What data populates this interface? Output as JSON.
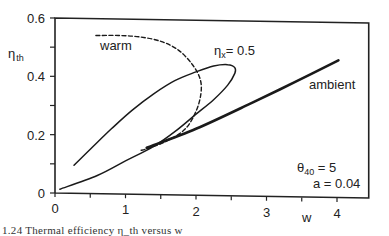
{
  "chart_data": {
    "type": "line",
    "title": "",
    "xlabel": "w",
    "ylabel": "η_th",
    "xlim": [
      0,
      4.45
    ],
    "ylim": [
      0,
      0.6
    ],
    "grid": false,
    "legend": "none (inline curve labels)",
    "x_ticks": [
      {
        "value": 0,
        "label": "0"
      },
      {
        "value": 0.5,
        "label": ""
      },
      {
        "value": 1,
        "label": "1"
      },
      {
        "value": 1.5,
        "label": ""
      },
      {
        "value": 2,
        "label": "2"
      },
      {
        "value": 2.5,
        "label": ""
      },
      {
        "value": 3,
        "label": "3"
      },
      {
        "value": 3.5,
        "label": ""
      },
      {
        "value": 4,
        "label": "4"
      }
    ],
    "y_ticks": [
      {
        "value": 0,
        "label": "0"
      },
      {
        "value": 0.1,
        "label": ""
      },
      {
        "value": 0.2,
        "label": "0.2"
      },
      {
        "value": 0.3,
        "label": ""
      },
      {
        "value": 0.4,
        "label": "0.4"
      },
      {
        "value": 0.5,
        "label": ""
      },
      {
        "value": 0.6,
        "label": "0.6"
      }
    ],
    "series": [
      {
        "name": "warm",
        "style": "dashed",
        "points": [
          [
            0.58,
            0.54
          ],
          [
            0.9,
            0.54
          ],
          [
            1.2,
            0.535
          ],
          [
            1.5,
            0.52
          ],
          [
            1.75,
            0.49
          ],
          [
            1.95,
            0.44
          ],
          [
            2.06,
            0.39
          ],
          [
            2.07,
            0.34
          ],
          [
            2.0,
            0.28
          ],
          [
            1.85,
            0.22
          ],
          [
            1.6,
            0.18
          ],
          [
            1.35,
            0.155
          ],
          [
            1.2,
            0.145
          ]
        ]
      },
      {
        "name": "η_x = 0.5",
        "style": "solid",
        "points": [
          [
            0.27,
            0.095
          ],
          [
            0.5,
            0.15
          ],
          [
            0.8,
            0.22
          ],
          [
            1.1,
            0.285
          ],
          [
            1.4,
            0.34
          ],
          [
            1.7,
            0.385
          ],
          [
            2.0,
            0.415
          ],
          [
            2.25,
            0.435
          ],
          [
            2.45,
            0.44
          ],
          [
            2.55,
            0.43
          ],
          [
            2.55,
            0.41
          ],
          [
            2.45,
            0.37
          ],
          [
            2.25,
            0.32
          ],
          [
            2.0,
            0.27
          ],
          [
            1.7,
            0.21
          ],
          [
            1.4,
            0.16
          ],
          [
            1.0,
            0.11
          ],
          [
            0.6,
            0.06
          ],
          [
            0.07,
            0.013
          ]
        ]
      },
      {
        "name": "ambient",
        "style": "solid-thick",
        "points": [
          [
            1.3,
            0.155
          ],
          [
            2.0,
            0.22
          ],
          [
            2.8,
            0.31
          ],
          [
            3.4,
            0.38
          ],
          [
            4.02,
            0.455
          ]
        ]
      }
    ],
    "annotations": [
      {
        "text": "warm",
        "x": 0.68,
        "y": 0.5
      },
      {
        "text": "η_x = 0.5",
        "x": 2.1,
        "y": 0.46
      },
      {
        "text": "ambient",
        "x": 2.95,
        "y": 0.38
      },
      {
        "text": "θ_40 =   5",
        "x": 3.15,
        "y": 0.11
      },
      {
        "text": "a = 0.04",
        "x": 3.3,
        "y": 0.05
      }
    ]
  },
  "labels": {
    "y_axis_main": "η",
    "y_axis_sub": "th",
    "x_axis": "w",
    "warm": "warm",
    "etax_main": "η",
    "etax_sub": "x",
    "etax_value": "= 0.5",
    "ambient": "ambient",
    "theta_main": "θ",
    "theta_sub": "40",
    "theta_value": " =   5",
    "a_param": "a = 0.04"
  },
  "caption": "1.24  Thermal efficiency η_th versus w"
}
